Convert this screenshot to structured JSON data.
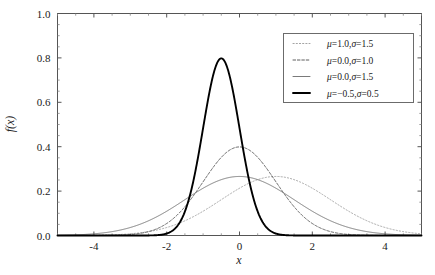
{
  "chart_data": {
    "type": "line",
    "title": "",
    "xlabel": "x",
    "ylabel": "f(x)",
    "xlim": [
      -5.0,
      5.0
    ],
    "ylim": [
      0.0,
      1.0
    ],
    "xticks": [
      -4,
      -2,
      0,
      2,
      4
    ],
    "xtick_labels": [
      "-4",
      "-2",
      "0",
      "2",
      "4"
    ],
    "yticks": [
      0.0,
      0.2,
      0.4,
      0.6,
      0.8,
      1.0
    ],
    "ytick_labels": [
      "0.0",
      "0.2",
      "0.4",
      "0.6",
      "0.8",
      "1.0"
    ],
    "grid": false,
    "minor_ticks": true,
    "legend_position": "upper right",
    "series": [
      {
        "name": "mu=1.0,sigma=1.5",
        "mu": 1.0,
        "sigma": 1.5,
        "peak": 0.266,
        "peak_x": 1.0,
        "style": "dotted",
        "color": "#9a9a9a",
        "width": 0.9,
        "legend_mu": "1.0",
        "legend_sigma": "1.5"
      },
      {
        "name": "mu=0.0,sigma=1.0",
        "mu": 0.0,
        "sigma": 1.0,
        "peak": 0.399,
        "peak_x": 0.0,
        "style": "dashed",
        "color": "#4d4d4d",
        "width": 0.9,
        "legend_mu": "0.0",
        "legend_sigma": "1.0"
      },
      {
        "name": "mu=0.0,sigma=1.5",
        "mu": 0.0,
        "sigma": 1.5,
        "peak": 0.266,
        "peak_x": 0.0,
        "style": "solid-thin",
        "color": "#6b6b6b",
        "width": 0.9,
        "legend_mu": "0.0",
        "legend_sigma": "1.5"
      },
      {
        "name": "mu=-0.5,sigma=0.5",
        "mu": -0.5,
        "sigma": 0.5,
        "peak": 0.798,
        "peak_x": -0.5,
        "style": "solid-thick",
        "color": "#000000",
        "width": 1.9,
        "legend_mu": "−0.5",
        "legend_sigma": "0.5"
      }
    ],
    "legend_entries": [
      {
        "mu": "1.0",
        "sigma": "1.5"
      },
      {
        "mu": "0.0",
        "sigma": "1.0"
      },
      {
        "mu": "0.0",
        "sigma": "1.5"
      },
      {
        "mu": "−0.5",
        "sigma": "0.5"
      }
    ],
    "symbols": {
      "mu": "μ",
      "sigma": "σ",
      "equals": "=",
      "comma": ","
    }
  },
  "axes": {
    "frame_color": "#555555",
    "background": "#ffffff"
  }
}
